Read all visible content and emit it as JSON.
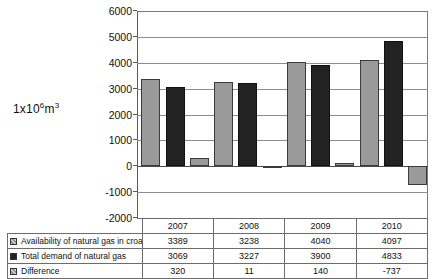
{
  "axis_unit_label": {
    "prefix": "1x10",
    "exponent": "6",
    "unit": "m",
    "unit_exponent": "3"
  },
  "colors": {
    "series_light": "#9a9a9a",
    "series_dark": "#232323",
    "gridline": "#8d8d8d",
    "frame": "#7a7a7a",
    "background": "#ffffff"
  },
  "legend": {
    "items": [
      {
        "label": "Availability of natural gas in croatia",
        "swatch": "light-hatched-swatch"
      },
      {
        "label": "Total demand of natural gas",
        "swatch": "dark-solid-swatch"
      },
      {
        "label": "Difference",
        "swatch": "light-hatched-swatch"
      }
    ]
  },
  "table": {
    "years": [
      "2007",
      "2008",
      "2009",
      "2010"
    ],
    "rows": [
      {
        "label": "Availability of natural gas in croatia",
        "values": [
          "3389",
          "3238",
          "4040",
          "4097"
        ]
      },
      {
        "label": "Total demand of natural gas",
        "values": [
          "3069",
          "3227",
          "3900",
          "4833"
        ]
      },
      {
        "label": "Difference",
        "values": [
          "320",
          "11",
          "140",
          "-737"
        ]
      }
    ]
  },
  "chart_data": {
    "type": "bar",
    "title": "",
    "xlabel": "",
    "ylabel": "1x10^6 m^3",
    "categories": [
      "2007",
      "2008",
      "2009",
      "2010"
    ],
    "series": [
      {
        "name": "Availability of natural gas in croatia",
        "values": [
          3389,
          3238,
          4040,
          4097
        ],
        "color": "#9a9a9a"
      },
      {
        "name": "Total demand of natural gas",
        "values": [
          3069,
          3227,
          3900,
          4833
        ],
        "color": "#232323"
      },
      {
        "name": "Difference",
        "values": [
          320,
          11,
          140,
          -737
        ],
        "color": "#9a9a9a"
      }
    ],
    "ylim": [
      -2000,
      6000
    ],
    "ytick_step": 1000,
    "yticks": [
      6000,
      5000,
      4000,
      3000,
      2000,
      1000,
      0,
      -1000,
      -2000
    ],
    "ytick_labels": [
      "6000",
      "5000",
      "4000",
      "3000",
      "2000",
      "1000",
      "0",
      "-1000",
      "-2000"
    ],
    "grid": true,
    "legend_position": "table-below"
  }
}
